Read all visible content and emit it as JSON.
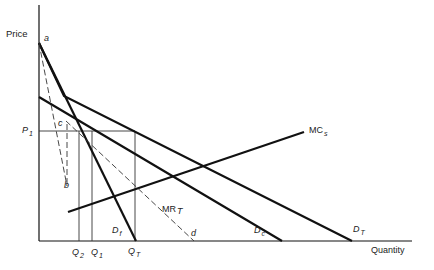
{
  "diagram": {
    "type": "economics-supply-demand",
    "axes": {
      "y_label": "Price",
      "x_label": "Quantity"
    },
    "colors": {
      "line": "#111111",
      "background": "#ffffff",
      "text": "#222222"
    },
    "points": {
      "a": "a",
      "b": "b",
      "c": "c",
      "d": "d"
    },
    "price_levels": [
      {
        "main": "P",
        "sub": "1"
      }
    ],
    "quantity_levels": [
      {
        "main": "Q",
        "sub": "2"
      },
      {
        "main": "Q",
        "sub": "1"
      },
      {
        "main": "Q",
        "sub": "T"
      }
    ],
    "curves": {
      "mc": {
        "main": "MC",
        "sub": "s"
      },
      "mr": {
        "main": "MR",
        "sub": "T"
      },
      "df": {
        "main": "D",
        "sub": "f"
      },
      "dc": {
        "main": "D",
        "sub": "c"
      },
      "dt": {
        "main": "D",
        "sub": "T"
      }
    }
  }
}
